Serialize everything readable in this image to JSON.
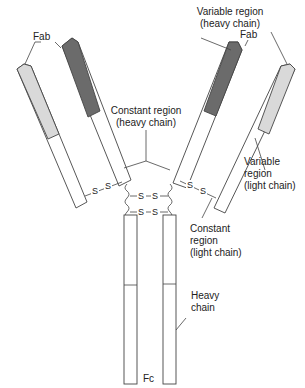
{
  "diagram": {
    "colors": {
      "heavy_variable": "#6b6b6b",
      "light_variable": "#d9d9d9",
      "constant": "#ffffff",
      "outline": "#444444"
    },
    "labels": {
      "fab_left": "Fab",
      "fab_right": "Fab",
      "variable_heavy_line1": "Variable region",
      "variable_heavy_line2": "(heavy chain)",
      "constant_heavy_line1": "Constant region",
      "constant_heavy_line2": "(heavy chain)",
      "variable_light_line1": "Variable",
      "variable_light_line2": "region",
      "variable_light_line3": "(light chain)",
      "constant_light_line1": "Constant",
      "constant_light_line2": "region",
      "constant_light_line3": "(light chain)",
      "heavy_chain_line1": "Heavy",
      "heavy_chain_line2": "chain",
      "fc": "Fc"
    },
    "disulfide_symbol": "S"
  }
}
